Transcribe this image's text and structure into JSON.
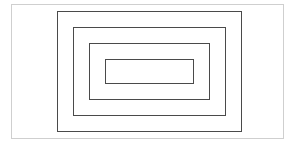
{
  "diagram": {
    "type": "nested-rectangles",
    "count": 5,
    "rectangles": [
      {
        "id": "outer-frame",
        "x": 11,
        "y": 4,
        "w": 273,
        "h": 135,
        "stroke": "#cfcfcf",
        "width": 1
      },
      {
        "id": "rect-1",
        "x": 57,
        "y": 11,
        "w": 185,
        "h": 121,
        "stroke": "#4a4a4a",
        "width": 1
      },
      {
        "id": "rect-2",
        "x": 73,
        "y": 27,
        "w": 153,
        "h": 89,
        "stroke": "#4a4a4a",
        "width": 1
      },
      {
        "id": "rect-3",
        "x": 89,
        "y": 43,
        "w": 121,
        "h": 57,
        "stroke": "#4a4a4a",
        "width": 1
      },
      {
        "id": "rect-4",
        "x": 105,
        "y": 59,
        "w": 89,
        "h": 25,
        "stroke": "#4a4a4a",
        "width": 1
      }
    ]
  }
}
